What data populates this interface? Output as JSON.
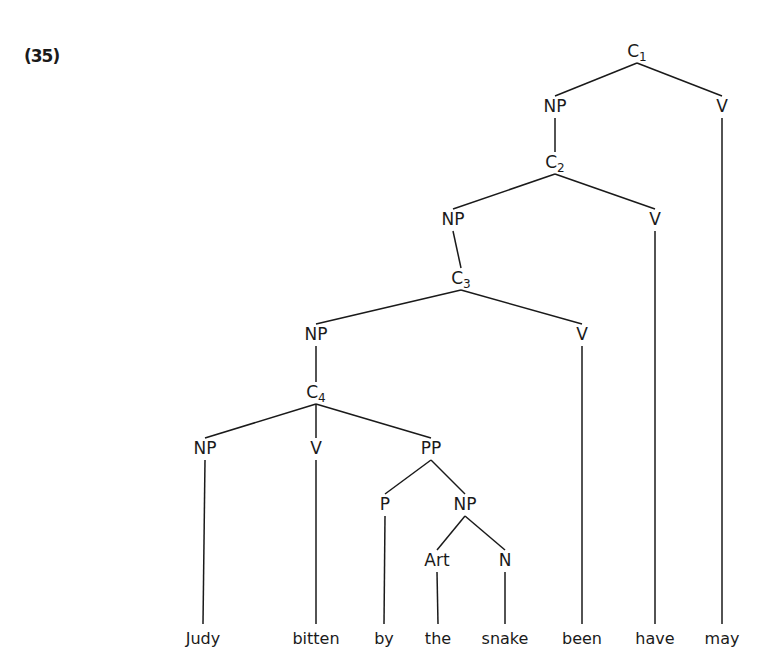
{
  "example_number": "(35)",
  "tree": {
    "nodes": [
      {
        "id": "C1",
        "label": "C",
        "sub": "1",
        "x": 637,
        "y": 57
      },
      {
        "id": "NP1",
        "label": "NP",
        "x": 555,
        "y": 112
      },
      {
        "id": "V1",
        "label": "V",
        "x": 722,
        "y": 112
      },
      {
        "id": "C2",
        "label": "C",
        "sub": "2",
        "x": 555,
        "y": 168
      },
      {
        "id": "NP2",
        "label": "NP",
        "x": 453,
        "y": 225
      },
      {
        "id": "V2",
        "label": "V",
        "x": 655,
        "y": 225
      },
      {
        "id": "C3",
        "label": "C",
        "sub": "3",
        "x": 461,
        "y": 284
      },
      {
        "id": "NP3",
        "label": "NP",
        "x": 316,
        "y": 340
      },
      {
        "id": "V3",
        "label": "V",
        "x": 582,
        "y": 340
      },
      {
        "id": "C4",
        "label": "C",
        "sub": "4",
        "x": 316,
        "y": 398
      },
      {
        "id": "NP4",
        "label": "NP",
        "x": 205,
        "y": 454
      },
      {
        "id": "V4",
        "label": "V",
        "x": 316,
        "y": 454
      },
      {
        "id": "PP",
        "label": "PP",
        "x": 431,
        "y": 454
      },
      {
        "id": "P",
        "label": "P",
        "x": 385,
        "y": 510
      },
      {
        "id": "NP5",
        "label": "NP",
        "x": 465,
        "y": 510
      },
      {
        "id": "Art",
        "label": "Art",
        "x": 437,
        "y": 566
      },
      {
        "id": "N",
        "label": "N",
        "x": 505,
        "y": 566
      }
    ],
    "edges": [
      [
        "C1",
        "NP1"
      ],
      [
        "C1",
        "V1"
      ],
      [
        "NP1",
        "C2"
      ],
      [
        "C2",
        "NP2"
      ],
      [
        "C2",
        "V2"
      ],
      [
        "NP2",
        "C3"
      ],
      [
        "C3",
        "NP3"
      ],
      [
        "C3",
        "V3"
      ],
      [
        "NP3",
        "C4"
      ],
      [
        "C4",
        "NP4"
      ],
      [
        "C4",
        "V4"
      ],
      [
        "C4",
        "PP"
      ],
      [
        "PP",
        "P"
      ],
      [
        "PP",
        "NP5"
      ],
      [
        "NP5",
        "Art"
      ],
      [
        "NP5",
        "N"
      ]
    ],
    "words": [
      {
        "text": "Judy",
        "x": 203,
        "parent": "NP4"
      },
      {
        "text": "bitten",
        "x": 316,
        "parent": "V4"
      },
      {
        "text": "by",
        "x": 384,
        "parent": "P"
      },
      {
        "text": "the",
        "x": 438,
        "parent": "Art"
      },
      {
        "text": "snake",
        "x": 505,
        "parent": "N"
      },
      {
        "text": "been",
        "x": 582,
        "parent": "V3"
      },
      {
        "text": "have",
        "x": 655,
        "parent": "V2"
      },
      {
        "text": "may",
        "x": 722,
        "parent": "V1"
      }
    ],
    "word_baseline": 644,
    "line_bottom": 624
  }
}
